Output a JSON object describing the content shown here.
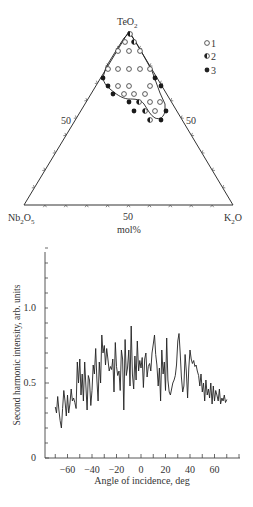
{
  "chart_data": [
    {
      "type": "scatter",
      "subtype": "ternary",
      "title": "",
      "vertices": {
        "top": "TeO2",
        "bottom_left": "Nb2O5",
        "bottom_right": "K2O"
      },
      "vertex_labels": {
        "top_main": "TeO",
        "top_sub": "2",
        "left_main1": "Nb",
        "left_sub1": "2",
        "left_main2": "O",
        "left_sub2": "5",
        "right_main1": "K",
        "right_sub1": "2",
        "right_main2": "O"
      },
      "edge_labels": {
        "left": "50",
        "right": "50",
        "bottom": "50"
      },
      "axis_unit": "mol%",
      "tick_step_mol_percent": 10,
      "legend": [
        {
          "marker": "open-circle",
          "label": "1"
        },
        {
          "marker": "half-filled-circle",
          "label": "2"
        },
        {
          "marker": "filled-circle",
          "label": "3"
        }
      ],
      "points_px": [
        {
          "x": 130,
          "y": 34,
          "type": 2
        },
        {
          "x": 125,
          "y": 42,
          "type": 1
        },
        {
          "x": 134,
          "y": 42,
          "type": 2
        },
        {
          "x": 118,
          "y": 51,
          "type": 1
        },
        {
          "x": 129,
          "y": 51,
          "type": 1
        },
        {
          "x": 140,
          "y": 51,
          "type": 1
        },
        {
          "x": 108,
          "y": 69,
          "type": 1
        },
        {
          "x": 118,
          "y": 69,
          "type": 1
        },
        {
          "x": 129,
          "y": 69,
          "type": 1
        },
        {
          "x": 140,
          "y": 69,
          "type": 1
        },
        {
          "x": 150,
          "y": 69,
          "type": 1
        },
        {
          "x": 103,
          "y": 78,
          "type": 3
        },
        {
          "x": 155,
          "y": 78,
          "type": 3
        },
        {
          "x": 108,
          "y": 86,
          "type": 3
        },
        {
          "x": 118,
          "y": 86,
          "type": 1
        },
        {
          "x": 129,
          "y": 86,
          "type": 1
        },
        {
          "x": 150,
          "y": 86,
          "type": 1
        },
        {
          "x": 161,
          "y": 86,
          "type": 3
        },
        {
          "x": 113,
          "y": 94,
          "type": 3
        },
        {
          "x": 124,
          "y": 94,
          "type": 1
        },
        {
          "x": 134,
          "y": 94,
          "type": 1
        },
        {
          "x": 145,
          "y": 94,
          "type": 1
        },
        {
          "x": 129,
          "y": 102,
          "type": 3
        },
        {
          "x": 139,
          "y": 102,
          "type": 2
        },
        {
          "x": 150,
          "y": 102,
          "type": 1
        },
        {
          "x": 160,
          "y": 102,
          "type": 1
        },
        {
          "x": 134,
          "y": 111,
          "type": 3
        },
        {
          "x": 145,
          "y": 111,
          "type": 2
        },
        {
          "x": 155,
          "y": 111,
          "type": 1
        },
        {
          "x": 166,
          "y": 111,
          "type": 3
        },
        {
          "x": 150,
          "y": 120,
          "type": 2
        },
        {
          "x": 161,
          "y": 120,
          "type": 3
        }
      ],
      "glass_region_boundary": "closed curve enclosing open-circle (glass-forming) compositions near TeO2 apex"
    },
    {
      "type": "line",
      "title": "",
      "xlabel": "Angle of incidence, deg",
      "ylabel": "Second harmonic intensity, arb. units",
      "xlim": [
        -75,
        80
      ],
      "ylim": [
        0,
        1.45
      ],
      "x_ticks": [
        -60,
        -40,
        -20,
        0,
        20,
        40,
        60
      ],
      "x_tick_labels": [
        "−60",
        "−40",
        "−20",
        "0",
        "20",
        "40",
        "60"
      ],
      "y_ticks": [
        0,
        0.5,
        1.0
      ],
      "y_tick_labels": [
        "0",
        "0.5",
        "1.0"
      ],
      "grid": false,
      "series": [
        {
          "name": "SHG intensity",
          "x": [
            -70,
            -69,
            -68,
            -67,
            -66,
            -65,
            -64,
            -63,
            -62,
            -61,
            -60,
            -59,
            -58,
            -57,
            -56,
            -55,
            -54,
            -53,
            -52,
            -51,
            -50,
            -49,
            -48,
            -47,
            -46,
            -45,
            -44,
            -43,
            -42,
            -41,
            -40,
            -39,
            -38,
            -37,
            -36,
            -35,
            -34,
            -33,
            -32,
            -31,
            -30,
            -29,
            -28,
            -27,
            -26,
            -25,
            -24,
            -23,
            -22,
            -21,
            -20,
            -19,
            -18,
            -17,
            -16,
            -15,
            -14,
            -13,
            -12,
            -11,
            -10,
            -9,
            -8,
            -7,
            -6,
            -5,
            -4,
            -3,
            -2,
            -1,
            0,
            1,
            2,
            3,
            4,
            5,
            6,
            7,
            8,
            9,
            10,
            11,
            12,
            13,
            14,
            15,
            16,
            17,
            18,
            19,
            20,
            21,
            22,
            23,
            24,
            25,
            26,
            27,
            28,
            29,
            30,
            31,
            32,
            33,
            34,
            35,
            36,
            37,
            38,
            39,
            40,
            41,
            42,
            43,
            44,
            45,
            46,
            47,
            48,
            49,
            50,
            51,
            52,
            53,
            54,
            55,
            56,
            57,
            58,
            59,
            60,
            61,
            62,
            63,
            64,
            65,
            66,
            67,
            68,
            69,
            70
          ],
          "y": [
            0.34,
            0.3,
            0.41,
            0.32,
            0.25,
            0.2,
            0.33,
            0.45,
            0.38,
            0.28,
            0.42,
            0.3,
            0.36,
            0.46,
            0.38,
            0.4,
            0.37,
            0.33,
            0.64,
            0.5,
            0.66,
            0.42,
            0.56,
            0.38,
            0.64,
            0.48,
            0.32,
            0.55,
            0.52,
            0.35,
            0.45,
            0.62,
            0.56,
            0.73,
            0.52,
            0.38,
            0.64,
            0.5,
            0.82,
            0.7,
            0.75,
            0.62,
            0.73,
            0.66,
            0.58,
            0.61,
            0.59,
            0.66,
            0.44,
            0.77,
            0.61,
            0.55,
            0.58,
            0.45,
            0.72,
            0.66,
            0.32,
            0.79,
            0.55,
            0.6,
            0.72,
            0.48,
            0.88,
            0.56,
            0.46,
            0.68,
            0.52,
            0.78,
            0.58,
            0.65,
            0.6,
            0.67,
            0.47,
            0.66,
            0.7,
            0.54,
            0.61,
            0.63,
            0.58,
            0.7,
            0.76,
            0.82,
            0.69,
            0.62,
            0.48,
            0.6,
            0.38,
            0.72,
            0.56,
            0.64,
            0.45,
            0.8,
            0.52,
            0.44,
            0.42,
            0.46,
            0.5,
            0.52,
            0.55,
            0.62,
            0.78,
            0.83,
            0.7,
            0.54,
            0.44,
            0.48,
            0.69,
            0.58,
            0.4,
            0.6,
            0.72,
            0.66,
            0.63,
            0.65,
            0.61,
            0.62,
            0.58,
            0.55,
            0.48,
            0.56,
            0.44,
            0.5,
            0.38,
            0.52,
            0.42,
            0.46,
            0.4,
            0.5,
            0.36,
            0.48,
            0.38,
            0.45,
            0.42,
            0.38,
            0.46,
            0.36,
            0.4,
            0.38,
            0.42,
            0.37,
            0.39
          ]
        }
      ]
    }
  ]
}
